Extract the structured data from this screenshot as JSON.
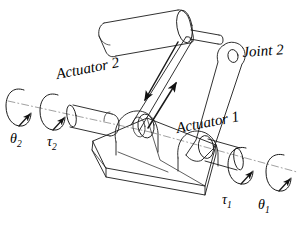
{
  "figure": {
    "style": "line-drawing",
    "stroke_color": "#1a1a1a",
    "background_color": "#ffffff"
  },
  "labels": {
    "actuator_2": "Actuator 2",
    "actuator_1": "Actuator 1",
    "joint_2": "Joint 2",
    "theta_2_symbol": "θ",
    "theta_2_sub": "2",
    "tau_2_symbol": "τ",
    "tau_2_sub": "2",
    "tau_1_symbol": "τ",
    "tau_1_sub": "1",
    "theta_1_symbol": "θ",
    "theta_1_sub": "1"
  },
  "parts": [
    {
      "name": "payload-cylinder",
      "description": "horizontal cylinder at top"
    },
    {
      "name": "upper-shaft",
      "description": "small shaft from cylinder end"
    },
    {
      "name": "right-link",
      "description": "arm link with pivot hole at top"
    },
    {
      "name": "left-link",
      "description": "slender connecting rod"
    },
    {
      "name": "base-bracket",
      "description": "triangular wedge base with two bearing bosses"
    },
    {
      "name": "left-shaft",
      "description": "stepped shaft on actuator 2 axis"
    },
    {
      "name": "right-shaft",
      "description": "shaft on actuator 1 axis"
    }
  ],
  "annotations": {
    "axis_2_centerline": "dash-dot axis through actuator 2",
    "axis_1_centerline": "dash-dot axis through actuator 1",
    "rotation_arrows": 4,
    "link_force_arrows": 2
  }
}
